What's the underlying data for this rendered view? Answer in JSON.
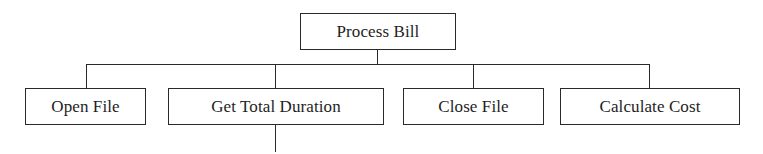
{
  "diagram": {
    "type": "structure-chart",
    "root": {
      "label": "Process Bill"
    },
    "children": [
      {
        "label": "Open File"
      },
      {
        "label": "Get Total Duration"
      },
      {
        "label": "Close File"
      },
      {
        "label": "Calculate Cost"
      }
    ],
    "colors": {
      "line": "#2a2a2a",
      "text": "#1e1e1e",
      "background": "#ffffff"
    }
  }
}
